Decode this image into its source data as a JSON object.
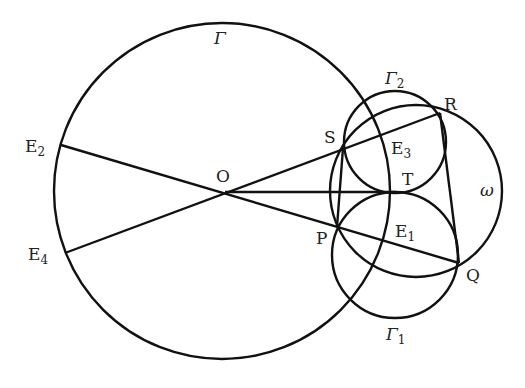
{
  "diagram": {
    "stroke_color": "#111111",
    "background": "#ffffff",
    "circles": [
      {
        "id": "Gamma",
        "label": "Γ",
        "cx": 222,
        "cy": 191,
        "r": 168
      },
      {
        "id": "Gamma2",
        "label": "Γ",
        "sub": "2",
        "cx": 395,
        "cy": 142,
        "r": 51
      },
      {
        "id": "Gamma1",
        "label": "Γ",
        "sub": "1",
        "cx": 395,
        "cy": 255,
        "r": 63
      },
      {
        "id": "omega",
        "label": "ω",
        "cx": 416,
        "cy": 191,
        "r": 86
      }
    ],
    "points": {
      "O": {
        "label": "O",
        "x": 225,
        "y": 192
      },
      "T": {
        "label": "T",
        "x": 396,
        "y": 192
      },
      "S": {
        "label": "S",
        "x": 343,
        "y": 148
      },
      "P": {
        "label": "P",
        "x": 337,
        "y": 227
      },
      "R": {
        "label": "R",
        "x": 440,
        "y": 113
      },
      "Q": {
        "label": "Q",
        "x": 459,
        "y": 263
      },
      "E1": {
        "label": "E",
        "sub": "1",
        "x": 388,
        "y": 238
      },
      "E2": {
        "label": "E",
        "sub": "2",
        "x": 61,
        "y": 145
      },
      "E3": {
        "label": "E",
        "sub": "3",
        "x": 386,
        "y": 147
      },
      "E4": {
        "label": "E",
        "sub": "4",
        "x": 65,
        "y": 253
      }
    },
    "segments": [
      [
        "E2",
        "Q"
      ],
      [
        "E4",
        "R"
      ],
      [
        "O",
        "T"
      ],
      [
        "S",
        "P"
      ],
      [
        "R",
        "Q"
      ]
    ],
    "labels": {
      "Gamma": "Γ",
      "Gamma2_main": "Γ",
      "Gamma2_sub": "2",
      "Gamma1_main": "Γ",
      "Gamma1_sub": "1",
      "omega": "ω",
      "O": "O",
      "T": "T",
      "S": "S",
      "P": "P",
      "R": "R",
      "Q": "Q",
      "E_main": "E",
      "E1_sub": "1",
      "E2_sub": "2",
      "E3_sub": "3",
      "E4_sub": "4"
    }
  }
}
